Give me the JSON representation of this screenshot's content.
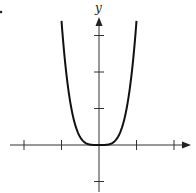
{
  "chart_data": {
    "type": "line",
    "title": "",
    "xlabel": "",
    "ylabel": "y",
    "function": "y = k·x^4 (even quartic, flat near origin)",
    "coefficient_k": 3.4,
    "x_range_plotted": [
      -1,
      1
    ],
    "xlim": [
      -2.4,
      2.45
    ],
    "ylim": [
      -1.3,
      3.5
    ],
    "x_ticks": [
      -2,
      -1,
      1,
      2
    ],
    "y_ticks": [
      -1,
      1,
      2,
      3
    ],
    "tick_labels_shown": false,
    "grid": false,
    "legend": null,
    "series": [
      {
        "name": "curve",
        "x": [
          -1,
          -0.9,
          -0.75,
          -0.5,
          -0.25,
          0,
          0.25,
          0.5,
          0.75,
          0.9,
          1
        ],
        "y": [
          3.4,
          2.23,
          1.08,
          0.21,
          0.01,
          0,
          0.01,
          0.21,
          1.08,
          2.23,
          3.4
        ]
      }
    ],
    "colors": {
      "curve": "#111111",
      "axes": "#333333"
    }
  },
  "layout": {
    "origin_px": [
      99,
      145
    ],
    "unit_x_px": 37.5,
    "unit_y_px": 36.5,
    "x_axis_px": [
      10,
      191
    ],
    "y_axis_px": [
      192,
      17
    ]
  },
  "labels": {
    "y_axis": "y",
    "corner_mark": "."
  }
}
